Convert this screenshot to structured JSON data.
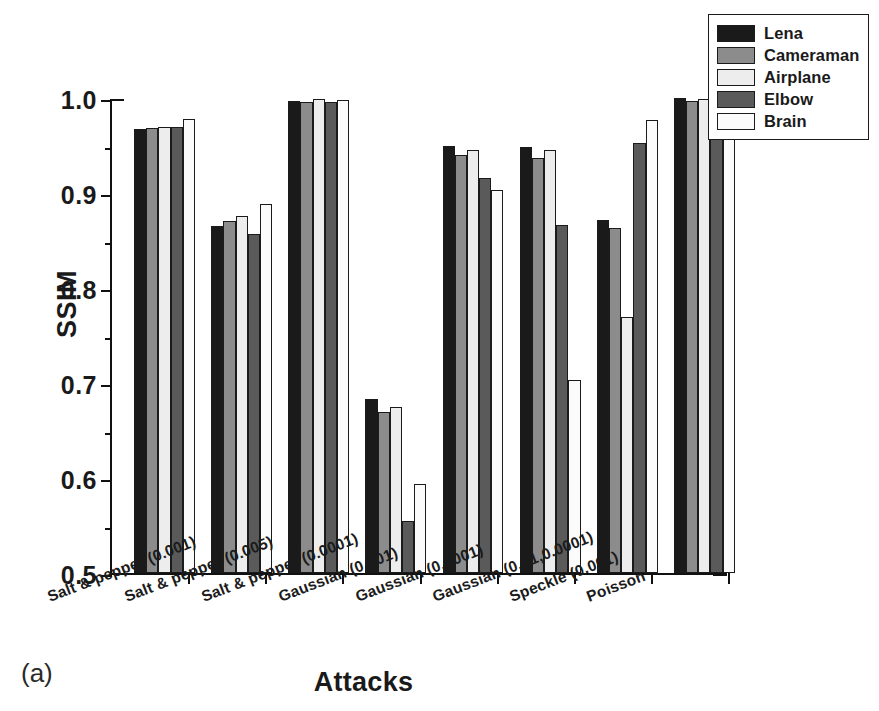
{
  "figure": {
    "panel_label": "(a)"
  },
  "legend": {
    "position": "top-right",
    "entries": [
      {
        "label": "Lena",
        "color": "#1a1a1a"
      },
      {
        "label": "Cameraman",
        "color": "#8c8c8c"
      },
      {
        "label": "Airplane",
        "color": "#ededed"
      },
      {
        "label": "Elbow",
        "color": "#5a5a5a"
      },
      {
        "label": "Brain",
        "color": "#fbfbfb"
      }
    ]
  },
  "chart_data": {
    "type": "bar",
    "title": "",
    "subtitle": "",
    "xlabel": "Attacks",
    "ylabel": "SSIM",
    "ylim": [
      0.5,
      1.0
    ],
    "ytick_labels": [
      "0.5",
      "0.6",
      "0.7",
      "0.8",
      "0.9",
      "1.0"
    ],
    "ytick_values": [
      0.5,
      0.6,
      0.7,
      0.8,
      0.9,
      1.0
    ],
    "yminor_values": [
      0.55,
      0.65,
      0.75,
      0.85,
      0.95
    ],
    "grid": false,
    "legend_position": "top-right",
    "categories": [
      "Salt & pepper (0.001)",
      "Salt & pepper (0.005)",
      "Salt & pepper (0.0001)",
      "Gaussian (0.001)",
      "Gaussian (0.0001)",
      "Gaussian (0.01,0.0001)",
      "Speckle (0.001)",
      "Poisson"
    ],
    "series": [
      {
        "name": "Lena",
        "color": "#1a1a1a",
        "values": [
          0.967,
          0.865,
          0.997,
          0.683,
          0.95,
          0.948,
          0.872,
          1.0
        ]
      },
      {
        "name": "Cameraman",
        "color": "#8c8c8c",
        "values": [
          0.968,
          0.871,
          0.996,
          0.67,
          0.94,
          0.937,
          0.863,
          0.997
        ]
      },
      {
        "name": "Airplane",
        "color": "#ededed",
        "values": [
          0.969,
          0.876,
          0.999,
          0.675,
          0.945,
          0.945,
          0.77,
          0.999
        ]
      },
      {
        "name": "Elbow",
        "color": "#5a5a5a",
        "values": [
          0.969,
          0.857,
          0.996,
          0.555,
          0.916,
          0.866,
          0.953,
          1.0
        ]
      },
      {
        "name": "Brain",
        "color": "#fbfbfb",
        "values": [
          0.978,
          0.888,
          0.998,
          0.594,
          0.903,
          0.703,
          0.977,
          1.0
        ]
      }
    ]
  }
}
